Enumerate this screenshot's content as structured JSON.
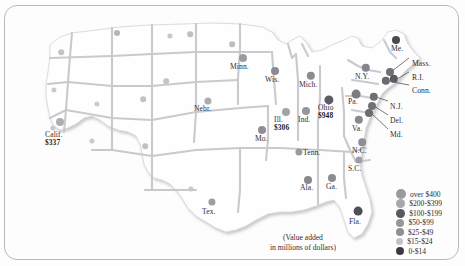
{
  "figure": {
    "kind": "choropleth-dot-map",
    "region": "United States",
    "caption_line1": "(Value added",
    "caption_line2": "in millions of dollars)"
  },
  "chart_data": {
    "type": "map",
    "title": "",
    "units": "millions of dollars",
    "value_label": "Value added",
    "legend": {
      "position": "bottom-right",
      "entries": [
        {
          "label": "over $400",
          "color": "#9a9a9e",
          "size": 5.0
        },
        {
          "label": "$200-$399",
          "color": "#a8a8ac",
          "size": 4.6
        },
        {
          "label": "$100-$199",
          "color": "#58585e",
          "size": 4.6
        },
        {
          "label": "$50-$99",
          "color": "#96969b",
          "size": 4.2
        },
        {
          "label": "$25-$49",
          "color": "#8e8e93",
          "size": 4.0
        },
        {
          "label": "$15-$24",
          "color": "#c3c3c7",
          "size": 3.6
        },
        {
          "label": "0-$14",
          "color": "#3a3a40",
          "size": 4.2
        }
      ]
    },
    "labeled_states": [
      {
        "abbr": "Calif.",
        "value": "$337",
        "x": 57,
        "y": 128,
        "dot_x": 60,
        "dot_y": 122,
        "dot_size": 4.0,
        "dot_color": "#adadb2",
        "lx": 45,
        "ly": 131
      },
      {
        "abbr": "Tex.",
        "value": "",
        "x": 212,
        "y": 212,
        "dot_x": 212,
        "dot_y": 202,
        "dot_size": 3.6,
        "dot_color": "#9d9da2",
        "lx": 202,
        "ly": 208
      },
      {
        "abbr": "Nebr.",
        "value": "",
        "x": 207,
        "y": 108,
        "dot_x": 208,
        "dot_y": 101,
        "dot_size": 3.6,
        "dot_color": "#acacb1",
        "lx": 194,
        "ly": 105
      },
      {
        "abbr": "Minn.",
        "value": "",
        "x": 243,
        "y": 66,
        "dot_x": 243,
        "dot_y": 58,
        "dot_size": 4.0,
        "dot_color": "#9b9ba0",
        "lx": 230,
        "ly": 63
      },
      {
        "abbr": "Wis.",
        "value": "",
        "x": 276,
        "y": 81,
        "dot_x": 275,
        "dot_y": 71,
        "dot_size": 4.0,
        "dot_color": "#8b8b90",
        "lx": 265,
        "ly": 76
      },
      {
        "abbr": "Mich.",
        "value": "",
        "x": 312,
        "y": 86,
        "dot_x": 311,
        "dot_y": 76,
        "dot_size": 4.2,
        "dot_color": "#8a8a8f",
        "lx": 299,
        "ly": 81
      },
      {
        "abbr": "Ill.",
        "value": "$306",
        "x": 285,
        "y": 121,
        "dot_x": 286,
        "dot_y": 112,
        "dot_size": 4.0,
        "dot_color": "#a3a3a8",
        "lx": 274,
        "ly": 116
      },
      {
        "abbr": "Ind.",
        "value": "",
        "x": 307,
        "y": 121,
        "dot_x": 306,
        "dot_y": 111,
        "dot_size": 4.0,
        "dot_color": "#96969b",
        "lx": 298,
        "ly": 116
      },
      {
        "abbr": "Ohio",
        "value": "$948",
        "x": 330,
        "y": 110,
        "dot_x": 329,
        "dot_y": 100,
        "dot_size": 4.6,
        "dot_color": "#5c5c62",
        "lx": 318,
        "ly": 104
      },
      {
        "abbr": "Mo.",
        "value": "",
        "x": 265,
        "y": 140,
        "dot_x": 262,
        "dot_y": 130,
        "dot_size": 4.0,
        "dot_color": "#8e8e93",
        "lx": 255,
        "ly": 135
      },
      {
        "abbr": "Tenn.",
        "value": "",
        "x": 312,
        "y": 153,
        "dot_x": 299,
        "dot_y": 152,
        "dot_size": 3.6,
        "dot_color": "#9a9a9f",
        "lx": 303,
        "ly": 149
      },
      {
        "abbr": "Ala.",
        "value": "",
        "x": 310,
        "y": 188,
        "dot_x": 308,
        "dot_y": 180,
        "dot_size": 4.0,
        "dot_color": "#88888d",
        "lx": 300,
        "ly": 184
      },
      {
        "abbr": "Ga.",
        "value": "",
        "x": 334,
        "y": 188,
        "dot_x": 332,
        "dot_y": 178,
        "dot_size": 4.0,
        "dot_color": "#8b8b90",
        "lx": 326,
        "ly": 183
      },
      {
        "abbr": "Fla.",
        "value": "",
        "x": 357,
        "y": 222,
        "dot_x": 358,
        "dot_y": 211,
        "dot_size": 4.4,
        "dot_color": "#4f4f56",
        "lx": 349,
        "ly": 218
      },
      {
        "abbr": "S.C.",
        "value": "",
        "x": 359,
        "y": 170,
        "dot_x": 359,
        "dot_y": 160,
        "dot_size": 3.6,
        "dot_color": "#9e9ea3",
        "lx": 348,
        "ly": 165
      },
      {
        "abbr": "N.C.",
        "value": "",
        "x": 363,
        "y": 152,
        "dot_x": 362,
        "dot_y": 142,
        "dot_size": 3.8,
        "dot_color": "#8d8d92",
        "lx": 352,
        "ly": 147
      },
      {
        "abbr": "Va.",
        "value": "",
        "x": 362,
        "y": 130,
        "dot_x": 359,
        "dot_y": 120,
        "dot_size": 4.2,
        "dot_color": "#87878c",
        "lx": 352,
        "ly": 125
      },
      {
        "abbr": "Pa.",
        "value": "",
        "x": 359,
        "y": 103,
        "dot_x": 356,
        "dot_y": 94,
        "dot_size": 4.4,
        "dot_color": "#7b7b81",
        "lx": 348,
        "ly": 98
      },
      {
        "abbr": "N.Y.",
        "value": "",
        "x": 366,
        "y": 78,
        "dot_x": 366,
        "dot_y": 68,
        "dot_size": 4.2,
        "dot_color": "#84848a",
        "lx": 355,
        "ly": 73
      },
      {
        "abbr": "Me.",
        "value": "",
        "x": 399,
        "y": 48,
        "dot_x": 396,
        "dot_y": 40,
        "dot_size": 4.0,
        "dot_color": "#49494f",
        "lx": 391,
        "ly": 45
      }
    ],
    "callout_states": [
      {
        "abbr": "Mass.",
        "lx": 412,
        "ly": 60,
        "dot_x": 390,
        "dot_y": 72,
        "dot_size": 4.0,
        "dot_color": "#6f6f75"
      },
      {
        "abbr": "R.I.",
        "lx": 412,
        "ly": 74,
        "dot_x": 394,
        "dot_y": 79,
        "dot_size": 4.2,
        "dot_color": "#5a5a60"
      },
      {
        "abbr": "Conn.",
        "lx": 412,
        "ly": 87,
        "dot_x": 386,
        "dot_y": 81,
        "dot_size": 4.2,
        "dot_color": "#6a6a70"
      },
      {
        "abbr": "N.J.",
        "lx": 390,
        "ly": 103,
        "dot_x": 374,
        "dot_y": 97,
        "dot_size": 4.2,
        "dot_color": "#6d6d73"
      },
      {
        "abbr": "Del.",
        "lx": 390,
        "ly": 117,
        "dot_x": 372,
        "dot_y": 106,
        "dot_size": 4.0,
        "dot_color": "#707076"
      },
      {
        "abbr": "Md.",
        "lx": 390,
        "ly": 131,
        "dot_x": 369,
        "dot_y": 113,
        "dot_size": 4.0,
        "dot_color": "#6b6b71"
      }
    ],
    "unlabeled_dots": [
      {
        "x": 117,
        "y": 33,
        "size": 3.0,
        "color": "#b5b5ba"
      },
      {
        "x": 61,
        "y": 52,
        "size": 2.8,
        "color": "#c4c4c8"
      },
      {
        "x": 54,
        "y": 90,
        "size": 2.6,
        "color": "#cacace"
      },
      {
        "x": 53,
        "y": 128,
        "size": 2.6,
        "color": "#c8c8cc"
      },
      {
        "x": 97,
        "y": 104,
        "size": 2.6,
        "color": "#cbcbd0"
      },
      {
        "x": 92,
        "y": 141,
        "size": 2.6,
        "color": "#c9c9ce"
      },
      {
        "x": 143,
        "y": 99,
        "size": 2.8,
        "color": "#c3c3c8"
      },
      {
        "x": 145,
        "y": 146,
        "size": 2.8,
        "color": "#c1c1c6"
      },
      {
        "x": 190,
        "y": 34,
        "size": 2.8,
        "color": "#bdbdc2"
      },
      {
        "x": 166,
        "y": 81,
        "size": 2.8,
        "color": "#c4c4c9"
      },
      {
        "x": 170,
        "y": 36,
        "size": 2.6,
        "color": "#c6c6cb"
      },
      {
        "x": 232,
        "y": 44,
        "size": 2.8,
        "color": "#bcbcc1"
      },
      {
        "x": 191,
        "y": 189,
        "size": 2.6,
        "color": "#c7c7cc"
      }
    ]
  }
}
